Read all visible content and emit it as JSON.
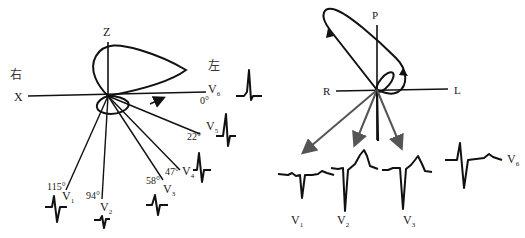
{
  "left_panel": {
    "axis_labels": {
      "z": "Z",
      "x": "X",
      "right_side": "右",
      "left_side": "左"
    },
    "leads": [
      {
        "name": "V",
        "sub": "6",
        "angle": "0°"
      },
      {
        "name": "V",
        "sub": "5",
        "angle": "22°"
      },
      {
        "name": "V",
        "sub": "4",
        "angle": "47°"
      },
      {
        "name": "V",
        "sub": "3",
        "angle": "58°"
      },
      {
        "name": "V",
        "sub": "2",
        "angle": "94°"
      },
      {
        "name": "V",
        "sub": "1",
        "angle": "115°"
      }
    ]
  },
  "right_panel": {
    "axis_labels": {
      "p": "P",
      "r": "R",
      "l": "L"
    },
    "leads": [
      {
        "name": "V",
        "sub": "1"
      },
      {
        "name": "V",
        "sub": "2"
      },
      {
        "name": "V",
        "sub": "3"
      },
      {
        "name": "V",
        "sub": "6"
      }
    ]
  }
}
